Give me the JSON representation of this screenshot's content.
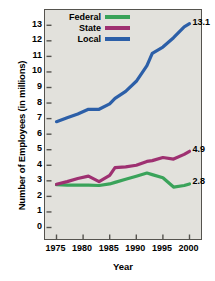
{
  "chart_data": {
    "type": "line",
    "title": "",
    "xlabel": "Year",
    "ylabel": "Number of Employees (in millions)",
    "xlim": [
      1975,
      2000
    ],
    "ylim": [
      0,
      13.5
    ],
    "grid": false,
    "legend_position": "top-left-inside",
    "xticks": [
      1975,
      1980,
      1985,
      1990,
      1995,
      2000
    ],
    "xtick_labels": [
      "1975",
      "1980",
      "1985",
      "1990",
      "1995",
      "2000"
    ],
    "yticks": [
      0,
      1,
      2,
      3,
      4,
      5,
      6,
      7,
      8,
      9,
      10,
      11,
      12,
      13
    ],
    "ytick_labels": [
      "0",
      "1",
      "2",
      "3",
      "4",
      "5",
      "6",
      "7",
      "8",
      "9",
      "10",
      "11",
      "12",
      "13"
    ],
    "x": [
      1975,
      1977,
      1979,
      1981,
      1983,
      1985,
      1986,
      1988,
      1990,
      1992,
      1993,
      1995,
      1997,
      1999,
      2000
    ],
    "series": [
      {
        "name": "Federal",
        "color": "#3aa35a",
        "values": [
          2.75,
          2.73,
          2.73,
          2.72,
          2.7,
          2.8,
          2.9,
          3.1,
          3.3,
          3.5,
          3.4,
          3.2,
          2.6,
          2.7,
          2.8
        ],
        "end_label": "2.8"
      },
      {
        "name": "State",
        "color": "#9e3071",
        "values": [
          2.78,
          2.95,
          3.15,
          3.3,
          2.95,
          3.35,
          3.85,
          3.9,
          4.0,
          4.25,
          4.3,
          4.5,
          4.4,
          4.7,
          4.9
        ],
        "end_label": "4.9"
      },
      {
        "name": "Local",
        "color": "#2c5fa8",
        "values": [
          6.8,
          7.05,
          7.3,
          7.6,
          7.6,
          7.95,
          8.3,
          8.75,
          9.4,
          10.4,
          11.2,
          11.6,
          12.2,
          12.9,
          13.1
        ],
        "end_label": "13.1"
      }
    ]
  },
  "legend": {
    "items": [
      {
        "label": "Federal",
        "color": "#3aa35a"
      },
      {
        "label": "State",
        "color": "#9e3071"
      },
      {
        "label": "Local",
        "color": "#2c5fa8"
      }
    ]
  },
  "axes": {
    "y_title": "Number of Employees (in millions)",
    "x_title": "Year"
  },
  "end_labels": {
    "local": "13.1",
    "state": "4.9",
    "federal": "2.8"
  },
  "caption_sliver": ""
}
